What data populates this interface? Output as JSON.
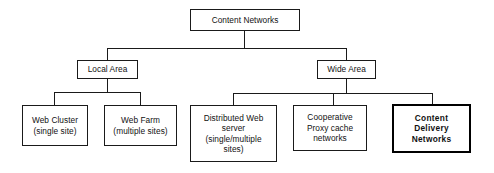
{
  "diagram": {
    "root": {
      "id": "content-networks",
      "label": "Content  Networks"
    },
    "level2": [
      {
        "id": "local-area",
        "label": "Local Area"
      },
      {
        "id": "wide-area",
        "label": "Wide Area"
      }
    ],
    "level3": [
      {
        "id": "web-cluster",
        "label": "Web Cluster\n(single site)",
        "parent": "local-area",
        "emphasis": false
      },
      {
        "id": "web-farm",
        "label": "Web Farm\n(multiple sites)",
        "parent": "local-area",
        "emphasis": false
      },
      {
        "id": "distributed-web-server",
        "label": "Distributed Web\nserver\n(single/multiple\nsites)",
        "parent": "wide-area",
        "emphasis": false
      },
      {
        "id": "cooperative-proxy-cache-networks",
        "label": "Cooperative\nProxy cache\nnetworks",
        "parent": "wide-area",
        "emphasis": false
      },
      {
        "id": "content-delivery-networks",
        "label": "Content\nDelivery\nNetworks",
        "parent": "wide-area",
        "emphasis": true
      }
    ],
    "colors": {
      "line": "#1a1a1a",
      "emphasis_border": "#000000",
      "background": "#ffffff",
      "text": "#111111"
    }
  }
}
